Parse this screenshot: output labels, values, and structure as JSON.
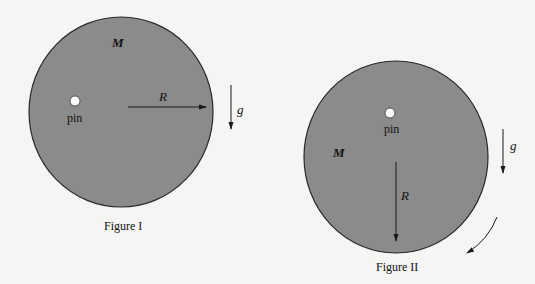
{
  "colors": {
    "background": "#f5f5f4",
    "disk_fill": "#8b8b8b",
    "disk_stroke": "#2a2a2a",
    "pin_fill": "#ffffff",
    "arrow": "#1a1a1a"
  },
  "figure1": {
    "caption": "Figure I",
    "mass_label": "M",
    "pin_label": "pin",
    "radius_label": "R",
    "gravity_label": "g",
    "radius_direction": "horizontal"
  },
  "figure2": {
    "caption": "Figure II",
    "mass_label": "M",
    "pin_label": "pin",
    "radius_label": "R",
    "gravity_label": "g",
    "radius_direction": "vertical-down",
    "rotation_indicator": "clockwise-arc-arrow"
  }
}
